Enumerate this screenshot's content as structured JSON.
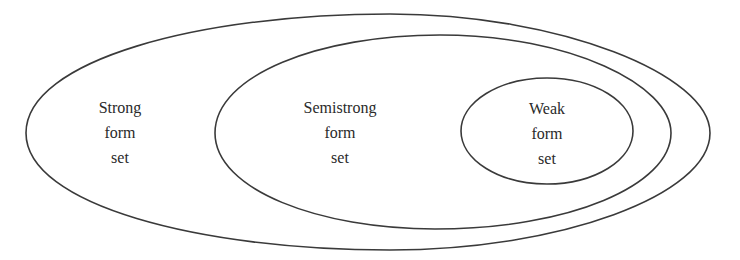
{
  "diagram": {
    "type": "nested-sets",
    "stroke_color": "#3a3a3a",
    "background": "#ffffff",
    "sets": [
      {
        "id": "strong",
        "label_lines": [
          "Strong",
          "form",
          "set"
        ],
        "contains": [
          "semistrong"
        ]
      },
      {
        "id": "semistrong",
        "label_lines": [
          "Semistrong",
          "form",
          "set"
        ],
        "contains": [
          "weak"
        ]
      },
      {
        "id": "weak",
        "label_lines": [
          "Weak",
          "form",
          "set"
        ],
        "contains": []
      }
    ]
  }
}
